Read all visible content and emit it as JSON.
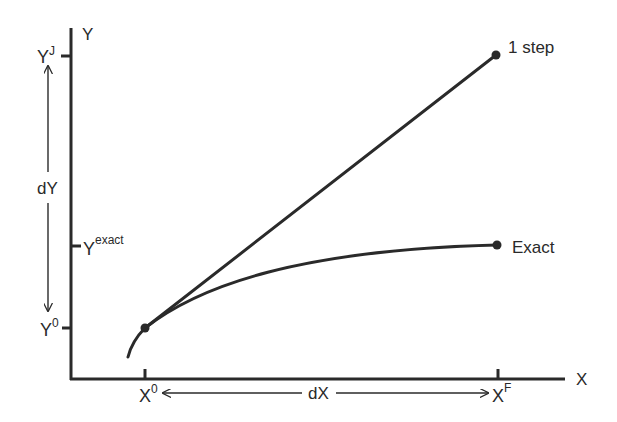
{
  "colors": {
    "background": "#ffffff",
    "ink": "#2a2a2a"
  },
  "axes": {
    "y_label": "Y",
    "x_label": "X"
  },
  "y_ticks": {
    "yj": {
      "base": "Y",
      "sup": "J"
    },
    "yexact": {
      "base": "Y",
      "sup": "exact"
    },
    "y0": {
      "base": "Y",
      "sup": "0"
    }
  },
  "x_ticks": {
    "x0": {
      "base": "X",
      "sup": "0"
    },
    "xf": {
      "base": "X",
      "sup": "F"
    }
  },
  "dimensions": {
    "dy_label": "dY",
    "dx_label": "dX"
  },
  "curves": {
    "one_step_label": "1 step",
    "exact_label": "Exact"
  }
}
